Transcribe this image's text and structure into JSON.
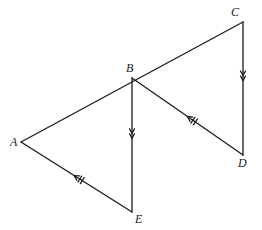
{
  "figure": {
    "type": "geometry-diagram",
    "width": 262,
    "height": 230,
    "background_color": "#ffffff",
    "stroke_color": "#1a1a1a",
    "stroke_width": 1.3
  },
  "points": [
    {
      "name": "A",
      "x": 21,
      "y": 142,
      "label": "A",
      "label_x": 10,
      "label_y": 136
    },
    {
      "name": "B",
      "x": 132,
      "y": 78,
      "label": "B",
      "label_x": 126,
      "label_y": 62
    },
    {
      "name": "C",
      "x": 243,
      "y": 22,
      "label": "C",
      "label_x": 231,
      "label_y": 6
    },
    {
      "name": "D",
      "x": 243,
      "y": 155,
      "label": "D",
      "label_x": 238,
      "label_y": 157
    },
    {
      "name": "E",
      "x": 132,
      "y": 212,
      "label": "E",
      "label_x": 135,
      "label_y": 213
    }
  ],
  "segments": [
    {
      "name": "AC",
      "from": "A",
      "to": "C",
      "x1": 21,
      "y1": 142,
      "x2": 243,
      "y2": 22,
      "marking": "none",
      "note": "straight line passing through B"
    },
    {
      "name": "BE",
      "from": "E",
      "to": "B",
      "x1": 132,
      "y1": 78,
      "x2": 132,
      "y2": 212,
      "marking": "double-chevron",
      "chevron_count": 2,
      "direction": "toward-B",
      "marker_t": 0.45
    },
    {
      "name": "CD",
      "from": "D",
      "to": "C",
      "x1": 243,
      "y1": 22,
      "x2": 243,
      "y2": 155,
      "marking": "double-chevron",
      "chevron_count": 2,
      "direction": "toward-C",
      "marker_t": 0.44
    },
    {
      "name": "EA",
      "from": "E",
      "to": "A",
      "x1": 132,
      "y1": 212,
      "x2": 21,
      "y2": 142,
      "marking": "arrow-with-ticks",
      "chevron_count": 1,
      "tick_count": 2,
      "direction": "toward-A",
      "marker_t": 0.52
    },
    {
      "name": "DB",
      "from": "D",
      "to": "B",
      "x1": 243,
      "y1": 155,
      "x2": 132,
      "y2": 78,
      "marking": "arrow-with-ticks",
      "chevron_count": 1,
      "tick_count": 2,
      "direction": "toward-B",
      "marker_t": 0.5
    }
  ],
  "labels": {
    "A": "A",
    "B": "B",
    "C": "C",
    "D": "D",
    "E": "E"
  }
}
